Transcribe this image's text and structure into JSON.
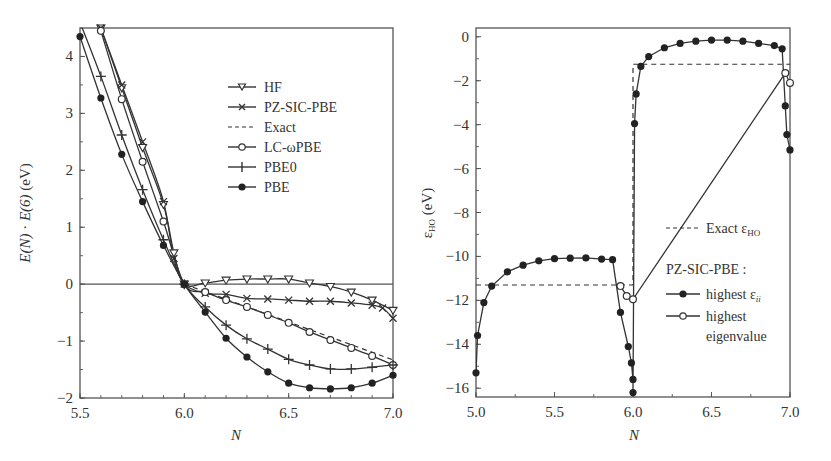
{
  "chart_data": [
    {
      "type": "line",
      "xlabel": "N",
      "ylabel": "E(N) · E(6) (eV)",
      "xlim": [
        5.5,
        7.0
      ],
      "ylim": [
        -2,
        4.5
      ],
      "xticks": [
        "5.5",
        "6.0",
        "6.5",
        "7.0"
      ],
      "yticks": [
        "−2",
        "−1",
        "0",
        "1",
        "2",
        "3",
        "4"
      ],
      "legend_position": "top-right",
      "series": [
        {
          "name": "HF",
          "marker": "triangle-down-open",
          "x": [
            5.6,
            5.7,
            5.8,
            5.9,
            5.95,
            6.0,
            6.1,
            6.2,
            6.3,
            6.4,
            6.5,
            6.6,
            6.7,
            6.8,
            6.9,
            7.0
          ],
          "y": [
            4.5,
            3.45,
            2.4,
            1.4,
            0.55,
            0,
            0.02,
            0.07,
            0.09,
            0.09,
            0.09,
            0.02,
            -0.04,
            -0.14,
            -0.28,
            -0.46
          ]
        },
        {
          "name": "PZ-SIC-PBE",
          "marker": "x",
          "x": [
            5.6,
            5.7,
            5.8,
            5.9,
            5.95,
            6.0,
            6.1,
            6.2,
            6.3,
            6.4,
            6.5,
            6.6,
            6.7,
            6.8,
            6.9,
            6.95,
            7.0
          ],
          "y": [
            4.5,
            3.5,
            2.5,
            1.45,
            0.45,
            0,
            -0.16,
            -0.18,
            -0.25,
            -0.26,
            -0.28,
            -0.3,
            -0.3,
            -0.33,
            -0.37,
            -0.42,
            -0.6
          ]
        },
        {
          "name": "Exact",
          "marker": "none",
          "dashed": true,
          "x": [
            6.0,
            7.0
          ],
          "y": [
            0,
            -1.33
          ]
        },
        {
          "name": "LC-ωPBE",
          "marker": "circle-open",
          "x": [
            5.6,
            5.7,
            5.8,
            5.9,
            6.0,
            6.1,
            6.2,
            6.3,
            6.4,
            6.5,
            6.6,
            6.7,
            6.8,
            6.9,
            7.0
          ],
          "y": [
            4.45,
            3.25,
            2.15,
            1.1,
            0,
            -0.14,
            -0.28,
            -0.4,
            -0.54,
            -0.68,
            -0.84,
            -0.98,
            -1.12,
            -1.26,
            -1.42
          ]
        },
        {
          "name": "PBE0",
          "marker": "plus",
          "x": [
            5.5,
            5.6,
            5.7,
            5.8,
            5.9,
            6.0,
            6.1,
            6.2,
            6.3,
            6.4,
            6.5,
            6.6,
            6.7,
            6.8,
            6.9,
            7.0
          ],
          "y": [
            4.6,
            3.65,
            2.62,
            1.66,
            0.78,
            0,
            -0.4,
            -0.72,
            -0.96,
            -1.14,
            -1.32,
            -1.42,
            -1.49,
            -1.49,
            -1.46,
            -1.42
          ]
        },
        {
          "name": "PBE",
          "marker": "circle-filled",
          "x": [
            5.5,
            5.6,
            5.7,
            5.8,
            5.9,
            6.0,
            6.1,
            6.2,
            6.3,
            6.4,
            6.5,
            6.6,
            6.7,
            6.8,
            6.9,
            7.0
          ],
          "y": [
            4.35,
            3.27,
            2.28,
            1.45,
            0.68,
            0,
            -0.49,
            -0.95,
            -1.28,
            -1.54,
            -1.74,
            -1.82,
            -1.84,
            -1.82,
            -1.74,
            -1.6
          ]
        }
      ]
    },
    {
      "type": "line",
      "xlabel": "N",
      "ylabel": "ε_HO (eV)",
      "xlim": [
        5.0,
        7.0
      ],
      "ylim": [
        -16.4,
        0.4
      ],
      "xticks": [
        "5.0",
        "5.5",
        "6.0",
        "6.5",
        "7.0"
      ],
      "yticks": [
        "−16",
        "−14",
        "−12",
        "−10",
        "−8",
        "−6",
        "−4",
        "−2",
        "0"
      ],
      "legend_position": "bottom-right",
      "legend_title": "PZ-SIC-PBE :",
      "series": [
        {
          "name": "Exact ε_HO",
          "marker": "none",
          "dashed": true,
          "x": [
            5.0,
            6.0,
            6.0,
            7.0
          ],
          "y": [
            -11.3,
            -11.3,
            -1.25,
            -1.25
          ]
        },
        {
          "name": "highest ε_ii",
          "marker": "circle-filled",
          "x": [
            5.0,
            5.01,
            5.05,
            5.1,
            5.2,
            5.3,
            5.4,
            5.5,
            5.6,
            5.7,
            5.8,
            5.87,
            5.92,
            5.97,
            5.99,
            6.0,
            6.0,
            6.01,
            6.02,
            6.05,
            6.1,
            6.2,
            6.3,
            6.4,
            6.5,
            6.6,
            6.7,
            6.8,
            6.9,
            6.95,
            6.97,
            6.98,
            7.0
          ],
          "y": [
            -15.3,
            -13.6,
            -12.1,
            -11.35,
            -10.7,
            -10.4,
            -10.2,
            -10.1,
            -10.08,
            -10.07,
            -10.12,
            -10.15,
            -12.55,
            -14.1,
            -14.85,
            -15.6,
            -16.2,
            -3.95,
            -2.6,
            -1.35,
            -0.9,
            -0.5,
            -0.3,
            -0.2,
            -0.15,
            -0.15,
            -0.2,
            -0.3,
            -0.4,
            -0.55,
            -3.15,
            -4.45,
            -5.15
          ]
        },
        {
          "name": "highest eigenvalue",
          "marker": "circle-open",
          "x": [
            5.92,
            5.96,
            6.0,
            6.97,
            7.0
          ],
          "y": [
            -11.35,
            -11.8,
            -11.95,
            -1.65,
            -2.1
          ]
        }
      ]
    }
  ],
  "legend_left": [
    "HF",
    "PZ-SIC-PBE",
    "Exact",
    "LC-ωPBE",
    "PBE0",
    "PBE"
  ],
  "legend_right": {
    "exact_label": "Exact ε",
    "exact_sub": "HO",
    "title": "PZ-SIC-PBE :",
    "item1": "highest ε",
    "item1_sub": "ii",
    "item2_line1": "highest",
    "item2_line2": "eigenvalue"
  },
  "labels": {
    "left_xlabel": "N",
    "left_ylabel_a": "E(N)",
    "left_ylabel_b": " · ",
    "left_ylabel_c": "E(6)",
    "left_ylabel_d": " (eV)",
    "right_xlabel": "N",
    "right_ylabel_eps": "ε",
    "right_ylabel_sub": "HO",
    "right_ylabel_unit": " (eV)"
  },
  "colors": {
    "ink": "#333333",
    "frame": "#555555"
  }
}
